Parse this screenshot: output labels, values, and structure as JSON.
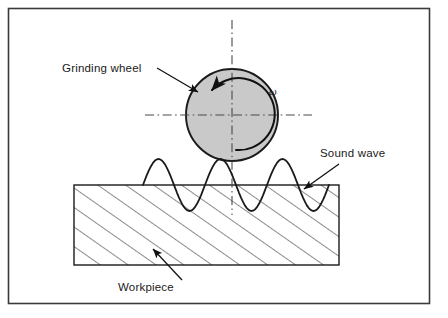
{
  "figure": {
    "background_color": "#ffffff",
    "frame": {
      "stroke_color": "#3a3a3a",
      "x": 8,
      "y": 8,
      "width": 422,
      "height": 296
    },
    "grinding_wheel": {
      "label": "Grinding wheel",
      "fill_color": "#c9c9c9",
      "stroke_color": "#1a1a1a",
      "center_x": 232,
      "center_y": 115,
      "radius": 46,
      "rotation_symbol": "ω",
      "rotation_direction": "counterclockwise"
    },
    "workpiece": {
      "label": "Workpiece",
      "fill_color": "#ffffff",
      "stroke_color": "#1a1a1a",
      "hatch_color": "#2b2b2b",
      "x": 74,
      "y": 185,
      "width": 265,
      "height": 80
    },
    "sound_wave": {
      "label": "Sound wave",
      "stroke_color": "#1a1a1a",
      "amplitude": 26,
      "wavelength": 62,
      "baseline_y": 185,
      "start_x": 143,
      "end_x": 329
    },
    "centerlines": {
      "style": "dash-dot",
      "stroke_color": "#4a4a4a",
      "horizontal": {
        "x1": 145,
        "x2": 312,
        "y": 115
      },
      "vertical": {
        "y1": 20,
        "y2": 215,
        "x": 232
      }
    },
    "leaders": [
      {
        "name": "grinding-wheel-leader",
        "label": "Grinding wheel",
        "text_x": 62,
        "text_y": 72,
        "line_x1": 157,
        "line_y1": 68,
        "line_x2": 198,
        "line_y2": 92
      },
      {
        "name": "sound-wave-leader",
        "label": "Sound wave",
        "text_x": 320,
        "text_y": 157,
        "line_x1": 339,
        "line_y1": 164,
        "line_x2": 304,
        "line_y2": 189
      },
      {
        "name": "workpiece-leader",
        "label": "Workpiece",
        "text_x": 118,
        "text_y": 291,
        "line_x1": 182,
        "line_y1": 280,
        "line_x2": 153,
        "line_y2": 249
      }
    ]
  }
}
